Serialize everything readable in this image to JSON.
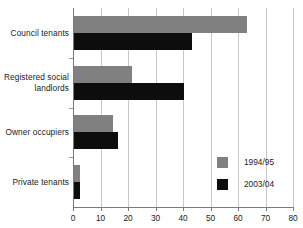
{
  "chart_data": {
    "type": "bar",
    "orientation": "horizontal",
    "title": "",
    "subtitle": "",
    "xlabel": "",
    "ylabel": "",
    "xlim": [
      0,
      80
    ],
    "xticks": [
      0,
      10,
      20,
      30,
      40,
      50,
      60,
      70,
      80
    ],
    "xtick_labels": [
      "0",
      "10",
      "20",
      "30",
      "40",
      "50",
      "60",
      "70",
      "80"
    ],
    "grid": "vertical",
    "legend_position": "bottom-right",
    "categories": [
      "Council tenants",
      "Registered social landlords",
      "Owner occupiers",
      "Private tenants"
    ],
    "category_label_lines": [
      [
        "Council tenants"
      ],
      [
        "Registered social",
        "landlords"
      ],
      [
        "Owner occupiers"
      ],
      [
        "Private tenants"
      ]
    ],
    "series": [
      {
        "name": "1994/95",
        "color": "#808080",
        "values": [
          63,
          21,
          14,
          2
        ]
      },
      {
        "name": "2003/04",
        "color": "#0d0d0d",
        "values": [
          43,
          40,
          16,
          2
        ]
      }
    ],
    "legend": [
      {
        "label": "1994/95",
        "color": "#808080"
      },
      {
        "label": "2003/04",
        "color": "#0d0d0d"
      }
    ],
    "colors": {
      "series_a": "#808080",
      "series_b": "#0d0d0d",
      "gridline": "#c8c8c8",
      "axis": "#7a7a7a",
      "background": "#ffffff",
      "text": "#1a1a1a"
    }
  }
}
